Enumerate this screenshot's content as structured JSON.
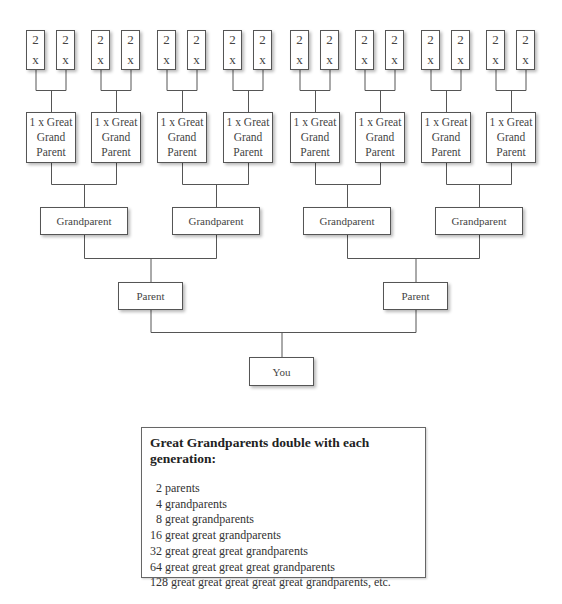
{
  "tree": {
    "top_generation": {
      "count": 16,
      "line1": "2",
      "line2": "x"
    },
    "great_grandparents": {
      "count": 8,
      "lines": [
        "1 x Great",
        "Grand",
        "Parent"
      ]
    },
    "grandparents": {
      "count": 4,
      "label": "Grandparent"
    },
    "parents": {
      "count": 2,
      "label": "Parent"
    },
    "self": {
      "label": "You"
    }
  },
  "info_box": {
    "title": "Great Grandparents double with each generation:",
    "items": [
      " 2 parents",
      " 4 grandparents",
      " 8 great grandparents",
      "16 great great grandparents",
      "32 great great great grandparents",
      "64 great great great great grandparents",
      "128 great great great great great grandparents, etc."
    ]
  }
}
